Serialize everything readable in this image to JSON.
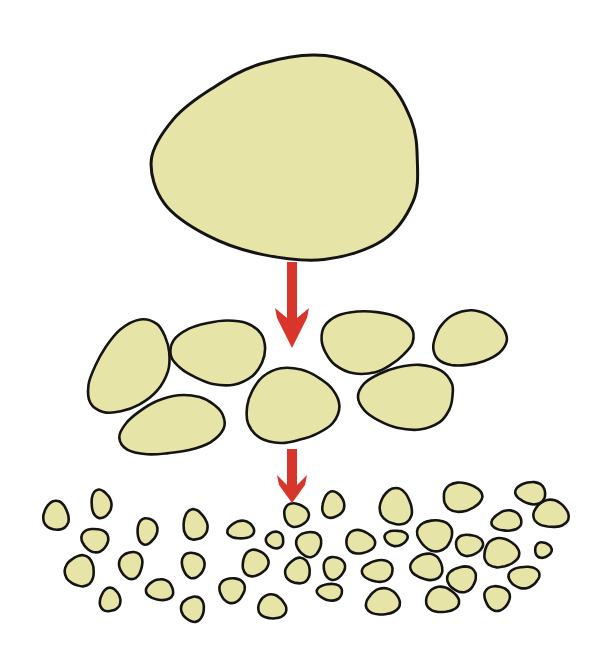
{
  "diagram": {
    "colors": {
      "background": "#ffffff",
      "particle_fill": "#e7e4a8",
      "particle_stroke": "#141414",
      "arrow": "#d9362b"
    },
    "stages": [
      {
        "name": "large-particle",
        "count": 1
      },
      {
        "name": "medium-particles",
        "count": 7
      },
      {
        "name": "small-particles",
        "count": 46
      }
    ],
    "arrows": [
      {
        "from": "large-particle",
        "to": "medium-particles",
        "direction": "down"
      },
      {
        "from": "medium-particles",
        "to": "small-particles",
        "direction": "down"
      }
    ]
  },
  "large": {
    "cx": 292,
    "cy": 160,
    "rx": 138,
    "ry": 98
  },
  "medium": [
    {
      "cx": 130,
      "cy": 368,
      "rx": 34,
      "ry": 51,
      "rot": 40
    },
    {
      "cx": 220,
      "cy": 352,
      "rx": 46,
      "ry": 33,
      "rot": -5
    },
    {
      "cx": 173,
      "cy": 426,
      "rx": 51,
      "ry": 29,
      "rot": -12
    },
    {
      "cx": 291,
      "cy": 406,
      "rx": 45,
      "ry": 38,
      "rot": 0
    },
    {
      "cx": 366,
      "cy": 341,
      "rx": 46,
      "ry": 31,
      "rot": 2
    },
    {
      "cx": 408,
      "cy": 397,
      "rx": 49,
      "ry": 31,
      "rot": 0
    },
    {
      "cx": 469,
      "cy": 339,
      "rx": 38,
      "ry": 26,
      "rot": -15
    }
  ],
  "small": [
    {
      "cx": 56,
      "cy": 516,
      "rx": 13,
      "ry": 14
    },
    {
      "cx": 101,
      "cy": 504,
      "rx": 10,
      "ry": 14
    },
    {
      "cx": 95,
      "cy": 540,
      "rx": 13,
      "ry": 12
    },
    {
      "cx": 80,
      "cy": 571,
      "rx": 14,
      "ry": 16
    },
    {
      "cx": 110,
      "cy": 600,
      "rx": 10,
      "ry": 12
    },
    {
      "cx": 147,
      "cy": 531,
      "rx": 10,
      "ry": 13
    },
    {
      "cx": 131,
      "cy": 565,
      "rx": 12,
      "ry": 13
    },
    {
      "cx": 160,
      "cy": 590,
      "rx": 14,
      "ry": 10
    },
    {
      "cx": 195,
      "cy": 525,
      "rx": 12,
      "ry": 15
    },
    {
      "cx": 193,
      "cy": 565,
      "rx": 11,
      "ry": 13
    },
    {
      "cx": 193,
      "cy": 609,
      "rx": 11,
      "ry": 13
    },
    {
      "cx": 241,
      "cy": 530,
      "rx": 13,
      "ry": 9
    },
    {
      "cx": 255,
      "cy": 563,
      "rx": 13,
      "ry": 13
    },
    {
      "cx": 232,
      "cy": 590,
      "rx": 13,
      "ry": 12
    },
    {
      "cx": 275,
      "cy": 540,
      "rx": 9,
      "ry": 8
    },
    {
      "cx": 272,
      "cy": 607,
      "rx": 14,
      "ry": 12
    },
    {
      "cx": 296,
      "cy": 515,
      "rx": 12,
      "ry": 12
    },
    {
      "cx": 309,
      "cy": 544,
      "rx": 12,
      "ry": 13
    },
    {
      "cx": 298,
      "cy": 571,
      "rx": 12,
      "ry": 13
    },
    {
      "cx": 333,
      "cy": 505,
      "rx": 11,
      "ry": 13
    },
    {
      "cx": 334,
      "cy": 568,
      "rx": 11,
      "ry": 11
    },
    {
      "cx": 330,
      "cy": 592,
      "rx": 13,
      "ry": 8
    },
    {
      "cx": 396,
      "cy": 507,
      "rx": 16,
      "ry": 18
    },
    {
      "cx": 360,
      "cy": 542,
      "rx": 14,
      "ry": 12
    },
    {
      "cx": 396,
      "cy": 538,
      "rx": 11,
      "ry": 8
    },
    {
      "cx": 378,
      "cy": 571,
      "rx": 15,
      "ry": 11
    },
    {
      "cx": 383,
      "cy": 602,
      "rx": 17,
      "ry": 13
    },
    {
      "cx": 462,
      "cy": 497,
      "rx": 20,
      "ry": 14
    },
    {
      "cx": 435,
      "cy": 535,
      "rx": 18,
      "ry": 15
    },
    {
      "cx": 427,
      "cy": 567,
      "rx": 16,
      "ry": 13
    },
    {
      "cx": 442,
      "cy": 600,
      "rx": 16,
      "ry": 13
    },
    {
      "cx": 469,
      "cy": 545,
      "rx": 13,
      "ry": 11
    },
    {
      "cx": 462,
      "cy": 579,
      "rx": 14,
      "ry": 13
    },
    {
      "cx": 507,
      "cy": 521,
      "rx": 15,
      "ry": 10
    },
    {
      "cx": 501,
      "cy": 553,
      "rx": 18,
      "ry": 14
    },
    {
      "cx": 497,
      "cy": 598,
      "rx": 13,
      "ry": 12
    },
    {
      "cx": 531,
      "cy": 493,
      "rx": 15,
      "ry": 11
    },
    {
      "cx": 551,
      "cy": 514,
      "rx": 17,
      "ry": 14
    },
    {
      "cx": 543,
      "cy": 550,
      "rx": 8,
      "ry": 8
    },
    {
      "cx": 524,
      "cy": 577,
      "rx": 15,
      "ry": 11
    }
  ],
  "arrow_shapes": [
    {
      "x": 292,
      "shaft_top": 262,
      "shaft_bottom": 312,
      "tip_y": 348,
      "half_width": 17,
      "shaft_half": 5
    },
    {
      "x": 292,
      "shaft_top": 449,
      "shaft_bottom": 479,
      "tip_y": 503,
      "half_width": 15,
      "shaft_half": 5
    }
  ]
}
